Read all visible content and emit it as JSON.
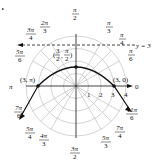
{
  "diagram": {
    "type": "polar-graph",
    "center": {
      "x": 76,
      "y": 86
    },
    "ring_spacing_px": 12.5,
    "rings": [
      1,
      2,
      3,
      4
    ],
    "ring_labels": [
      "1",
      "2",
      "3",
      "4"
    ],
    "angle_labels": [
      {
        "id": "a0",
        "text": "0"
      },
      {
        "id": "a_pi6",
        "num": "π",
        "den": "6"
      },
      {
        "id": "a_pi4",
        "num": "π",
        "den": "4"
      },
      {
        "id": "a_pi3",
        "num": "π",
        "den": "3"
      },
      {
        "id": "a_pi2",
        "num": "π",
        "den": "2"
      },
      {
        "id": "a_2pi3",
        "num": "2π",
        "den": "3"
      },
      {
        "id": "a_3pi4",
        "num": "3π",
        "den": "4"
      },
      {
        "id": "a_5pi6",
        "num": "5π",
        "den": "6"
      },
      {
        "id": "a_pi",
        "text": "π"
      },
      {
        "id": "a_7pi6",
        "num": "7π",
        "den": "6"
      },
      {
        "id": "a_5pi4",
        "num": "5π",
        "den": "4"
      },
      {
        "id": "a_4pi3",
        "num": "4π",
        "den": "3"
      },
      {
        "id": "a_3pi2",
        "num": "3π",
        "den": "2"
      },
      {
        "id": "a_5pi3",
        "num": "5π",
        "den": "3"
      },
      {
        "id": "a_7pi4",
        "num": "7π",
        "den": "4"
      },
      {
        "id": "a_11pi6",
        "num": "11π",
        "den": "6"
      }
    ],
    "points": [
      {
        "label": "(3, π)",
        "r": 3,
        "theta": "π"
      },
      {
        "label": "(3, 0)",
        "r": 3,
        "theta": "0"
      },
      {
        "label_num": "3",
        "label_den": "2",
        "label_theta_num": "π",
        "label_theta_den": "2",
        "r": 1.5,
        "theta": "π/2"
      }
    ],
    "line_label": "y = 3",
    "labels": {
      "pt_3pi": "(3, π)",
      "pt_30": "(3, 0)",
      "pt_top_open": "(",
      "pt_top_num": "3",
      "pt_top_den": "2",
      "pt_top_comma": ",",
      "pt_top_tnum": "π",
      "pt_top_tden": "2",
      "pt_top_close": ")",
      "line": "y = 3",
      "r1": "1",
      "r2": "2",
      "r3": "3",
      "r4": "4",
      "zero": "0",
      "pi": "π",
      "pi2_num": "π",
      "pi2_den": "2",
      "pi3_num": "π",
      "pi3_den": "3",
      "pi4_num": "π",
      "pi4_den": "4",
      "pi6_num": "π",
      "pi6_den": "6",
      "2pi3_num": "2π",
      "2pi3_den": "3",
      "3pi4_num": "3π",
      "3pi4_den": "4",
      "5pi6_num": "5π",
      "5pi6_den": "6",
      "7pi6_num": "7π",
      "7pi6_den": "6",
      "5pi4_num": "5π",
      "5pi4_den": "4",
      "4pi3_num": "4π",
      "4pi3_den": "3",
      "3pi2_num": "3π",
      "3pi2_den": "2",
      "5pi3_num": "5π",
      "5pi3_den": "3",
      "7pi4_num": "7π",
      "7pi4_den": "4",
      "11pi6_num": "11π",
      "11pi6_den": "6"
    },
    "colors": {
      "grid": "#b5b5b5",
      "curve": "#111111",
      "axes": "#111111"
    }
  }
}
